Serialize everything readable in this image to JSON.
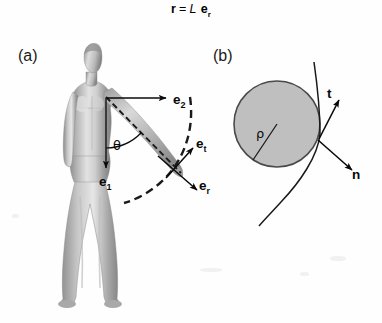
{
  "figure": {
    "equation": {
      "lhs": "r",
      "relation": "=",
      "scalar": "L",
      "unit_vector_base": "e",
      "unit_vector_sub": "r",
      "full_text": "r = L er"
    },
    "panels": [
      {
        "id": "a",
        "label": "(a)",
        "description": "human-figure-arm-polar-basis",
        "labels": [
          {
            "name": "e2",
            "base": "e",
            "sub": "2",
            "x": 173,
            "y": 92
          },
          {
            "name": "e1",
            "base": "e",
            "sub": "1",
            "x": 99,
            "y": 174
          },
          {
            "name": "et",
            "base": "e",
            "sub": "t",
            "x": 196,
            "y": 136
          },
          {
            "name": "er",
            "base": "e",
            "sub": "r",
            "x": 199,
            "y": 178
          },
          {
            "name": "theta",
            "base": "θ",
            "sub": "",
            "x": 113,
            "y": 138
          }
        ]
      },
      {
        "id": "b",
        "label": "(b)",
        "description": "osculating-circle-tangent-normal",
        "labels": [
          {
            "name": "t",
            "base": "t",
            "sub": "",
            "x": 327,
            "y": 86
          },
          {
            "name": "n",
            "base": "n",
            "sub": "",
            "x": 352,
            "y": 175
          },
          {
            "name": "rho",
            "base": "ρ",
            "sub": "",
            "x": 258,
            "y": 128
          }
        ],
        "circle": {
          "cx": 277,
          "cy": 124,
          "r": 43,
          "fill": "#bfbfbf",
          "stroke": "#4a4a4a"
        }
      }
    ],
    "colors": {
      "background": "#fefefe",
      "ink": "#0a0a0a",
      "circle_fill": "#bfbfbf",
      "circle_stroke": "#4a4a4a",
      "body_dark": "#7c7c7c",
      "body_light": "#d8d8d8"
    }
  }
}
